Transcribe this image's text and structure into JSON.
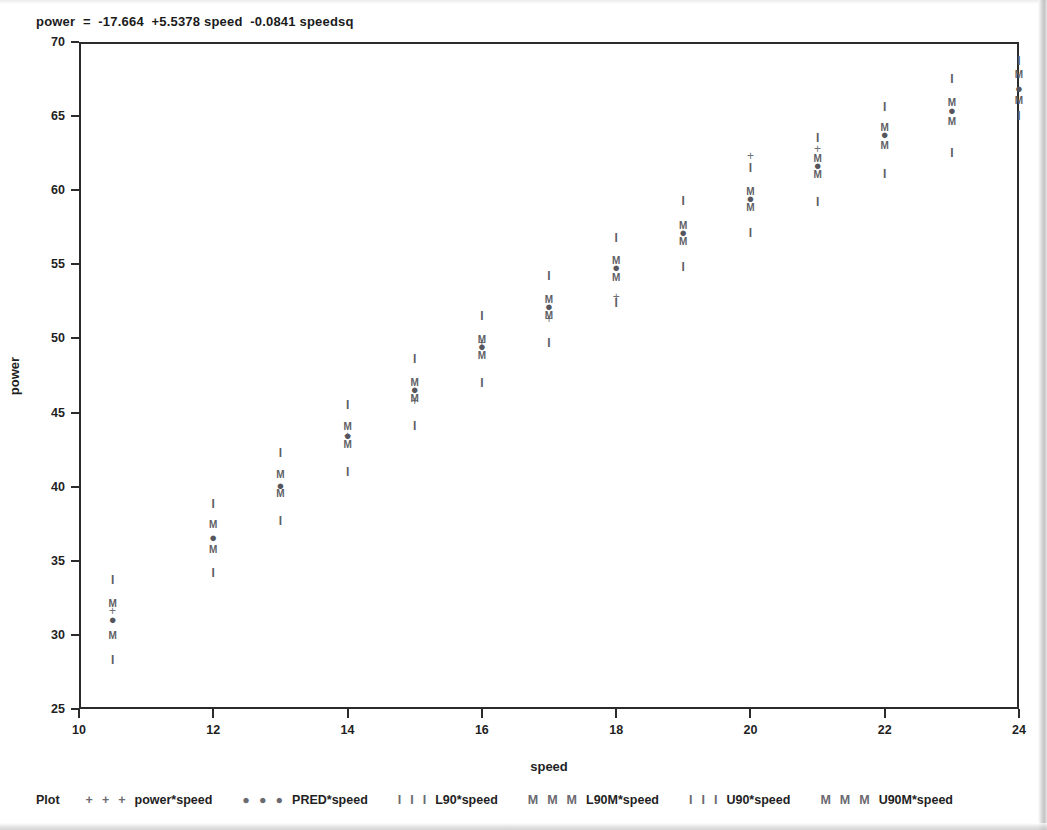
{
  "figure": {
    "equation": "power  =  -17.664  +5.5378 speed  -0.0841 speedsq",
    "x_axis_label": "speed",
    "y_axis_label": "power"
  },
  "legend": {
    "title": "Plot",
    "entries": [
      {
        "symbol": "+",
        "symbol_name": "plus-marker",
        "label": "power*speed"
      },
      {
        "symbol": "●",
        "symbol_name": "dot-marker",
        "label": "PRED*speed"
      },
      {
        "symbol": "I",
        "symbol_name": "bar-marker",
        "label": "L90*speed"
      },
      {
        "symbol": "M",
        "symbol_name": "m-marker",
        "label": "L90M*speed"
      },
      {
        "symbol": "I",
        "symbol_name": "bar-marker",
        "label": "U90*speed"
      },
      {
        "symbol": "M",
        "symbol_name": "m-marker",
        "label": "U90M*speed"
      }
    ]
  },
  "chart_data": {
    "type": "scatter",
    "title": "power  =  -17.664  +5.5378 speed  -0.0841 speedsq",
    "xlabel": "speed",
    "ylabel": "power",
    "xlim": [
      10,
      24
    ],
    "ylim": [
      25,
      70
    ],
    "xticks": [
      10,
      12,
      14,
      16,
      18,
      20,
      22,
      24
    ],
    "yticks": [
      25,
      30,
      35,
      40,
      45,
      50,
      55,
      60,
      65,
      70
    ],
    "grid": false,
    "legend_position": "bottom",
    "x": [
      10.5,
      12,
      13,
      14,
      15,
      16,
      17,
      18,
      19,
      20,
      21,
      22,
      23,
      24
    ],
    "series": [
      {
        "name": "power*speed",
        "marker": "+",
        "values": [
          31.6,
          null,
          null,
          43.4,
          45.8,
          49.7,
          51.3,
          52.8,
          null,
          62.3,
          62.8,
          null,
          null,
          null
        ]
      },
      {
        "name": "PRED*speed",
        "marker": "●",
        "values": [
          31.1,
          36.6,
          40.1,
          43.5,
          46.6,
          49.5,
          52.2,
          54.8,
          57.2,
          59.5,
          61.7,
          63.8,
          65.4,
          66.9
        ]
      },
      {
        "name": "L90*speed",
        "marker": "I",
        "values": [
          28.3,
          34.2,
          37.7,
          41.0,
          44.1,
          47.0,
          49.7,
          52.4,
          54.8,
          57.1,
          59.2,
          61.1,
          62.5,
          65.0
        ]
      },
      {
        "name": "L90M*speed",
        "marker": "M",
        "values": [
          29.9,
          35.7,
          39.5,
          42.8,
          45.9,
          48.8,
          51.5,
          54.1,
          56.5,
          58.8,
          61.0,
          63.0,
          64.6,
          66.0
        ]
      },
      {
        "name": "U90*speed",
        "marker": "I",
        "values": [
          33.7,
          38.8,
          42.3,
          45.5,
          48.6,
          51.5,
          54.2,
          56.8,
          59.3,
          61.5,
          63.5,
          65.6,
          67.5,
          68.7
        ]
      },
      {
        "name": "U90M*speed",
        "marker": "M",
        "values": [
          32.1,
          37.4,
          40.8,
          44.0,
          47.0,
          49.9,
          52.6,
          55.2,
          57.6,
          59.9,
          62.1,
          64.2,
          65.9,
          67.8
        ]
      }
    ]
  }
}
